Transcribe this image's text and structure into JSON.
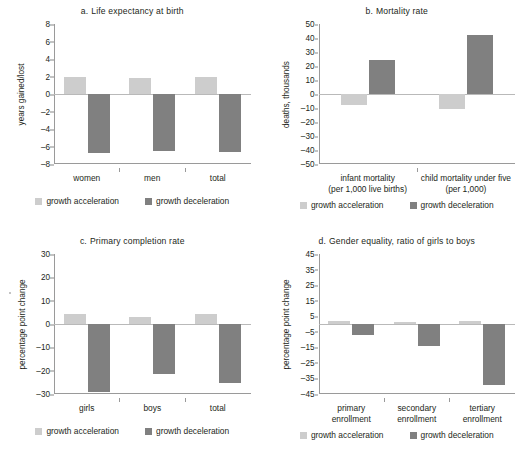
{
  "figure": {
    "legend_accel": "growth acceleration",
    "legend_decel": "growth deceleration",
    "color_accel": "#cdcdcd",
    "color_decel": "#808080"
  },
  "chart_data": [
    {
      "type": "bar",
      "panel": "a",
      "panel_letter": "a.",
      "title": "Life expectancy at birth",
      "ylabel": "years gained/lost",
      "xlabel": "",
      "categories": [
        "women",
        "men",
        "total"
      ],
      "series": [
        {
          "name": "growth acceleration",
          "values": [
            2.0,
            1.85,
            2.0
          ],
          "color": "#cdcdcd"
        },
        {
          "name": "growth deceleration",
          "values": [
            -6.7,
            -6.55,
            -6.6
          ],
          "color": "#808080"
        }
      ],
      "yticks": [
        8,
        6,
        4,
        2,
        0,
        -2,
        -4,
        -6,
        -8
      ],
      "ytick_labels": [
        "8",
        "6",
        "4",
        "2",
        "0",
        "–2",
        "–4",
        "–6",
        "–8"
      ],
      "ylim": [
        -8,
        8
      ],
      "grid": false,
      "legend_position": "bottom"
    },
    {
      "type": "bar",
      "panel": "b",
      "panel_letter": "b.",
      "title": "Mortality rate",
      "ylabel": "deaths, thousands",
      "xlabel": "",
      "categories": [
        "infant mortality\n(per 1,000 live births)",
        "child mortality under five\n(per 1,000)"
      ],
      "category_lines": [
        [
          "infant mortality",
          "(per 1,000 live births)"
        ],
        [
          "child mortality under five",
          "(per 1,000)"
        ]
      ],
      "series": [
        {
          "name": "growth acceleration",
          "values": [
            -8.0,
            -11.0
          ],
          "color": "#cdcdcd"
        },
        {
          "name": "growth deceleration",
          "values": [
            24.0,
            42.0
          ],
          "color": "#808080"
        }
      ],
      "yticks": [
        50,
        40,
        30,
        20,
        10,
        0,
        -10,
        -20,
        -30,
        -40,
        -50
      ],
      "ytick_labels": [
        "50",
        "40",
        "30",
        "20",
        "10",
        "0",
        "–10",
        "–20",
        "–30",
        "–40",
        "–50"
      ],
      "ylim": [
        -50,
        50
      ],
      "grid": false,
      "legend_position": "bottom"
    },
    {
      "type": "bar",
      "panel": "c",
      "panel_letter": "c.",
      "title": "Primary completion rate",
      "ylabel": "percentage point change",
      "xlabel": "",
      "categories": [
        "girls",
        "boys",
        "total"
      ],
      "series": [
        {
          "name": "growth acceleration",
          "values": [
            4.4,
            3.1,
            4.1
          ],
          "color": "#cdcdcd"
        },
        {
          "name": "growth deceleration",
          "values": [
            -29.0,
            -21.5,
            -25.3
          ],
          "color": "#808080"
        }
      ],
      "yticks": [
        30,
        20,
        10,
        0,
        -10,
        -20,
        -30
      ],
      "ytick_labels": [
        "30",
        "20",
        "10",
        "0",
        "–10",
        "–20",
        "–30"
      ],
      "ylim": [
        -30,
        30
      ],
      "grid": false,
      "legend_position": "bottom"
    },
    {
      "type": "bar",
      "panel": "d",
      "panel_letter": "d.",
      "title": "Gender equality, ratio of girls to boys",
      "ylabel": "percentage point change",
      "xlabel": "",
      "categories": [
        "primary\nenrollment",
        "secondary\nenrollment",
        "tertiary\nenrollment"
      ],
      "category_lines": [
        [
          "primary",
          "enrollment"
        ],
        [
          "secondary",
          "enrollment"
        ],
        [
          "tertiary",
          "enrollment"
        ]
      ],
      "series": [
        {
          "name": "growth acceleration",
          "values": [
            2.0,
            1.2,
            2.2
          ],
          "color": "#cdcdcd"
        },
        {
          "name": "growth deceleration",
          "values": [
            -7.0,
            -14.0,
            -39.5
          ],
          "color": "#808080"
        }
      ],
      "yticks": [
        45,
        35,
        25,
        15,
        5,
        -5,
        -15,
        -25,
        -35,
        -45
      ],
      "ytick_labels": [
        "45",
        "35",
        "25",
        "15",
        "5",
        "–5",
        "–15",
        "–25",
        "–35",
        "–45"
      ],
      "ylim": [
        -45,
        45
      ],
      "grid": false,
      "legend_position": "bottom"
    }
  ]
}
